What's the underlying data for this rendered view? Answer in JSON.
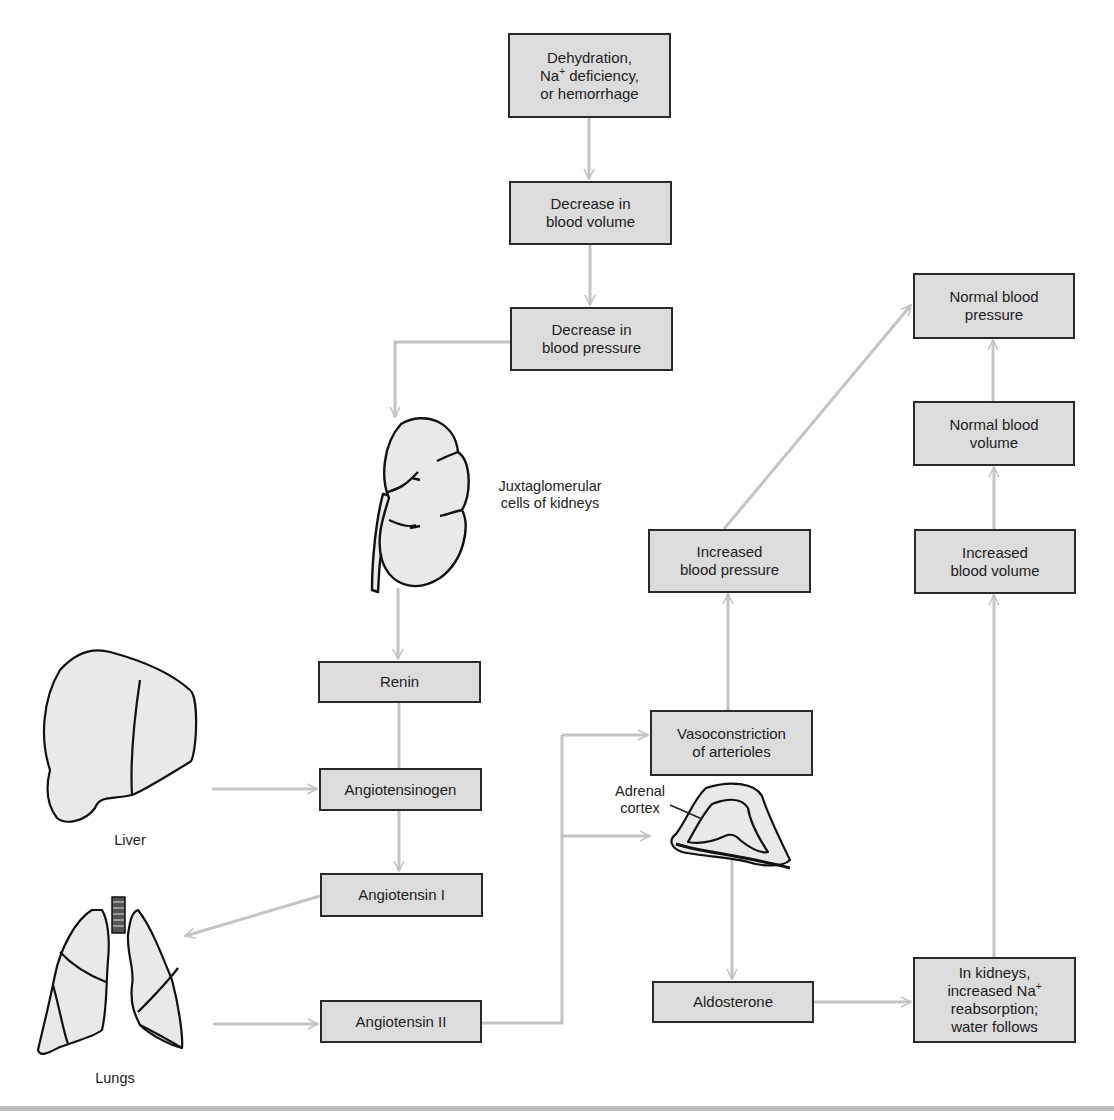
{
  "diagram": {
    "title_fragment": "(... continued)",
    "nodes": {
      "dehydration": {
        "line1": "Dehydration,",
        "line2_pre": "Na",
        "line2_sup": "+",
        "line2_post": " deficiency,",
        "line3": "or hemorrhage"
      },
      "decrease_blood_volume": "Decrease in\nblood volume",
      "decrease_blood_pressure": "Decrease in\nblood pressure",
      "normal_blood_pressure": "Normal blood\npressure",
      "normal_blood_volume": "Normal blood\nvolume",
      "increased_blood_pressure": "Increased\nblood pressure",
      "increased_blood_volume": "Increased\nblood volume",
      "renin": "Renin",
      "vasoconstriction": "Vasoconstriction\nof arterioles",
      "angiotensinogen": "Angiotensinogen",
      "angiotensin_1": "Angiotensin I",
      "angiotensin_2": "Angiotensin II",
      "aldosterone": "Aldosterone",
      "kidney_reabsorption": {
        "line1": "In kidneys,",
        "line2_pre": "increased Na",
        "line2_sup": "+",
        "line3": "reabsorption;",
        "line4": "water follows"
      }
    },
    "labels": {
      "kidney": "Juxtaglomerular\ncells of kidneys",
      "liver": "Liver",
      "lungs": "Lungs",
      "adrenal": "Adrenal\ncortex"
    },
    "edges": [
      {
        "from": "dehydration",
        "to": "decrease_blood_volume"
      },
      {
        "from": "decrease_blood_volume",
        "to": "decrease_blood_pressure"
      },
      {
        "from": "decrease_blood_pressure",
        "to": "kidney"
      },
      {
        "from": "kidney",
        "to": "renin"
      },
      {
        "from": "renin",
        "to": "angiotensinogen"
      },
      {
        "from": "liver",
        "to": "angiotensinogen"
      },
      {
        "from": "angiotensinogen",
        "to": "angiotensin_1"
      },
      {
        "from": "angiotensin_1",
        "to": "lungs"
      },
      {
        "from": "lungs",
        "to": "angiotensin_2"
      },
      {
        "from": "angiotensin_2",
        "to": "vasoconstriction"
      },
      {
        "from": "angiotensin_2",
        "to": "adrenal_cortex"
      },
      {
        "from": "vasoconstriction",
        "to": "increased_blood_pressure"
      },
      {
        "from": "increased_blood_pressure",
        "to": "normal_blood_pressure"
      },
      {
        "from": "adrenal_cortex",
        "to": "aldosterone"
      },
      {
        "from": "aldosterone",
        "to": "kidney_reabsorption"
      },
      {
        "from": "kidney_reabsorption",
        "to": "increased_blood_volume"
      },
      {
        "from": "increased_blood_volume",
        "to": "normal_blood_volume"
      },
      {
        "from": "normal_blood_volume",
        "to": "normal_blood_pressure"
      }
    ],
    "colors": {
      "box_fill": "#dcdcdc",
      "box_border": "#2a2a2a",
      "arrow": "#c4c4c4",
      "organ_fill": "#e9e9e9",
      "organ_stroke": "#111111"
    }
  }
}
